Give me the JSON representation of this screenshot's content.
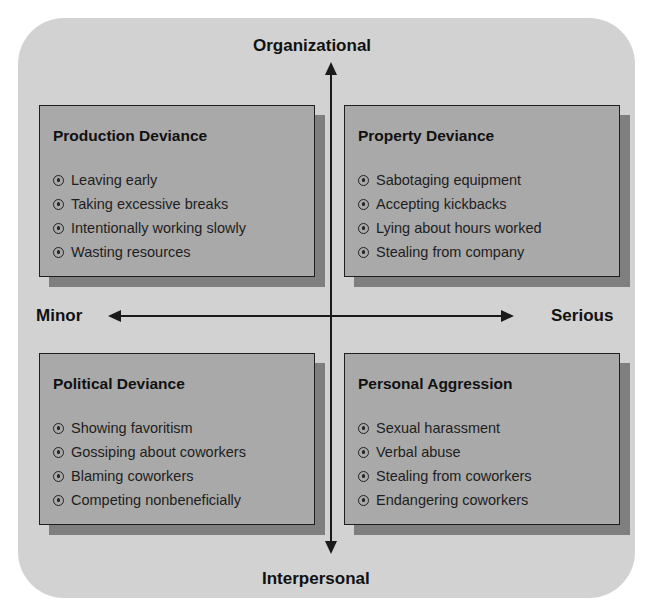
{
  "axes": {
    "top": "Organizational",
    "bottom": "Interpersonal",
    "left": "Minor",
    "right": "Serious"
  },
  "quadrants": [
    {
      "position": "top-left",
      "title": "Production Deviance",
      "items": [
        "Leaving early",
        "Taking excessive breaks",
        "Intentionally working slowly",
        "Wasting resources"
      ]
    },
    {
      "position": "top-right",
      "title": "Property Deviance",
      "items": [
        "Sabotaging equipment",
        "Accepting kickbacks",
        "Lying about hours worked",
        "Stealing from company"
      ]
    },
    {
      "position": "bottom-left",
      "title": "Political Deviance",
      "items": [
        "Showing favoritism",
        "Gossiping about coworkers",
        "Blaming coworkers",
        "Competing nonbeneficially"
      ]
    },
    {
      "position": "bottom-right",
      "title": "Personal Aggression",
      "items": [
        "Sexual harassment",
        "Verbal abuse",
        "Stealing from coworkers",
        "Endangering coworkers"
      ]
    }
  ],
  "colors": {
    "panel": "#d2d2d2",
    "box": "#a9a9a9",
    "shadow": "#7f7f7f",
    "ink": "#111111"
  }
}
